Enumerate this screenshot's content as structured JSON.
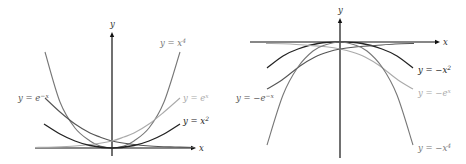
{
  "chart_data": [
    {
      "type": "line",
      "title": "",
      "xlabel": "x",
      "ylabel": "y",
      "grid": false,
      "legend": "inline labels",
      "origin_px": [
        112,
        148
      ],
      "series": [
        {
          "name": "y = x^4",
          "label_main": "y = x",
          "label_sup": "4",
          "color": "#777777",
          "width": 1.1,
          "points": [
            [
              45,
              52
            ],
            [
              60,
              102
            ],
            [
              75,
              128
            ],
            [
              90,
              141
            ],
            [
              100,
              146
            ],
            [
              112,
              148
            ],
            [
              124,
              146
            ],
            [
              134,
              141
            ],
            [
              149,
              128
            ],
            [
              164,
              102
            ],
            [
              180,
              52
            ]
          ],
          "label_pos": [
            160,
            46
          ]
        },
        {
          "name": "y = e^-x",
          "label_main": "y = e",
          "label_sup": "−x",
          "color": "#555555",
          "width": 1.1,
          "points": [
            [
              45,
              98
            ],
            [
              60,
              112
            ],
            [
              75,
              124
            ],
            [
              90,
              133
            ],
            [
              100,
              137
            ],
            [
              112,
              141
            ],
            [
              130,
              144
            ],
            [
              150,
              146
            ],
            [
              175,
              147
            ],
            [
              195,
              147.5
            ]
          ],
          "label_pos": [
            18,
            101
          ]
        },
        {
          "name": "y = e^x",
          "label_main": "y = e",
          "label_sup": "x",
          "color": "#aaaaaa",
          "width": 1.1,
          "points": [
            [
              35,
              147.5
            ],
            [
              55,
              147
            ],
            [
              75,
              146
            ],
            [
              95,
              144
            ],
            [
              112,
              141
            ],
            [
              124,
              137
            ],
            [
              134,
              133
            ],
            [
              149,
              124
            ],
            [
              164,
              112
            ],
            [
              180,
              98
            ]
          ],
          "label_pos": [
            183,
            101
          ]
        },
        {
          "name": "y = x^2",
          "label_main": "y = x",
          "label_sup": "2",
          "color": "#222222",
          "width": 1.3,
          "points": [
            [
              44,
              124
            ],
            [
              60,
              134
            ],
            [
              75,
              141
            ],
            [
              90,
              145.5
            ],
            [
              112,
              148
            ],
            [
              134,
              145.5
            ],
            [
              149,
              141
            ],
            [
              164,
              134
            ],
            [
              180,
              124
            ]
          ],
          "label_pos": [
            183,
            124
          ]
        }
      ],
      "axis_labels": {
        "x": "x",
        "y": "y"
      }
    },
    {
      "type": "line",
      "title": "",
      "xlabel": "x",
      "ylabel": "y",
      "grid": false,
      "legend": "inline labels",
      "origin_px": [
        340,
        42
      ],
      "series": [
        {
          "name": "y = -x^2",
          "label_main": "y = −x",
          "label_sup": "2",
          "color": "#222222",
          "width": 1.3,
          "points": [
            [
              267,
              68
            ],
            [
              283,
              56
            ],
            [
              298,
              49
            ],
            [
              318,
              43.5
            ],
            [
              340,
              42
            ],
            [
              362,
              43.5
            ],
            [
              382,
              49
            ],
            [
              397,
              56
            ],
            [
              413,
              68
            ]
          ],
          "label_pos": [
            418,
            73
          ]
        },
        {
          "name": "y = -e^x",
          "label_main": "y = −e",
          "label_sup": "x",
          "color": "#aaaaaa",
          "width": 1.1,
          "points": [
            [
              266,
              43.5
            ],
            [
              290,
              44
            ],
            [
              310,
              45.5
            ],
            [
              328,
              47
            ],
            [
              340,
              49
            ],
            [
              352,
              52
            ],
            [
              365,
              57
            ],
            [
              380,
              66
            ],
            [
              398,
              80
            ],
            [
              413,
              89
            ]
          ],
          "label_pos": [
            418,
            96
          ]
        },
        {
          "name": "y = -e^-x",
          "label_main": "y = −e",
          "label_sup": "−x",
          "color": "#555555",
          "width": 1.1,
          "points": [
            [
              267,
              89
            ],
            [
              282,
              80
            ],
            [
              300,
              66
            ],
            [
              315,
              57
            ],
            [
              328,
              52
            ],
            [
              340,
              49
            ],
            [
              355,
              47
            ],
            [
              375,
              45.5
            ],
            [
              395,
              44
            ],
            [
              414,
              43.5
            ]
          ],
          "label_pos": [
            236,
            101
          ]
        },
        {
          "name": "y = -x^4",
          "label_main": "y = −x",
          "label_sup": "4",
          "color": "#777777",
          "width": 1.1,
          "points": [
            [
              267,
              145
            ],
            [
              283,
              95
            ],
            [
              298,
              67
            ],
            [
              313,
              51
            ],
            [
              325,
              45
            ],
            [
              340,
              42
            ],
            [
              355,
              45
            ],
            [
              367,
              51
            ],
            [
              382,
              67
            ],
            [
              397,
              95
            ],
            [
              413,
              145
            ]
          ],
          "label_pos": [
            418,
            151
          ]
        }
      ],
      "axis_labels": {
        "x": "x",
        "y": "y"
      }
    }
  ],
  "axes": [
    {
      "x_axis": {
        "x1": 35,
        "x2": 196,
        "y": 148
      },
      "y_axis": {
        "x": 112,
        "y1": 32,
        "y2": 156
      },
      "x_label_pos": [
        199,
        151
      ],
      "y_label_pos": [
        110,
        27
      ]
    },
    {
      "x_axis": {
        "x1": 250,
        "x2": 440,
        "y": 42
      },
      "y_axis": {
        "x": 340,
        "y1": 18,
        "y2": 158
      },
      "x_label_pos": [
        443,
        45
      ],
      "y_label_pos": [
        338,
        13
      ]
    }
  ]
}
